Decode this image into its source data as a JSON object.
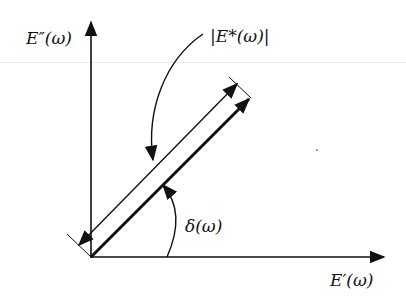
{
  "diagram": {
    "labels": {
      "y_axis": "E″(ω)",
      "x_axis": "E′(ω)",
      "magnitude": "|E*(ω)|",
      "phase_angle": "δ(ω)"
    },
    "elements": [
      {
        "id": "x-axis",
        "type": "arrow",
        "label": "E′(ω)"
      },
      {
        "id": "y-axis",
        "type": "arrow",
        "label": "E″(ω)"
      },
      {
        "id": "complex-modulus-vector",
        "type": "thick-arrow",
        "from": "origin"
      },
      {
        "id": "magnitude-dimension",
        "type": "double-arrow",
        "label": "|E*(ω)|"
      },
      {
        "id": "phase-angle-arc",
        "type": "arc-arrow",
        "label": "δ(ω)"
      }
    ],
    "colors": {
      "ink": "#111111",
      "background": "#ffffff"
    }
  }
}
